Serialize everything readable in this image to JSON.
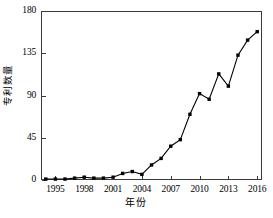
{
  "chart_data": {
    "type": "line",
    "title": "",
    "xlabel": "年份",
    "ylabel": "专利数量",
    "xlim": [
      1993.5,
      2016.5
    ],
    "ylim": [
      0,
      180
    ],
    "grid": false,
    "legend": null,
    "marker": "filled-square",
    "line_color": "#000000",
    "x": [
      1994,
      1995,
      1996,
      1997,
      1998,
      1999,
      2000,
      2001,
      2002,
      2003,
      2004,
      2005,
      2006,
      2007,
      2008,
      2009,
      2010,
      2011,
      2012,
      2013,
      2014,
      2015,
      2016
    ],
    "values": [
      1,
      1,
      1,
      2,
      3,
      2,
      2,
      3,
      7,
      9,
      6,
      16,
      23,
      36,
      43,
      70,
      92,
      86,
      113,
      100,
      133,
      149,
      158
    ],
    "series": [
      {
        "name": "专利数量",
        "values": [
          1,
          1,
          1,
          2,
          3,
          2,
          2,
          3,
          7,
          9,
          6,
          16,
          23,
          36,
          43,
          70,
          92,
          86,
          113,
          100,
          133,
          149,
          158
        ]
      }
    ],
    "xticks": [
      1995,
      1998,
      2001,
      2004,
      2007,
      2010,
      2013,
      2016
    ],
    "xtick_labels": [
      "1995",
      "1998",
      "2001",
      "2004",
      "2007",
      "2010",
      "2013",
      "2016"
    ],
    "yticks": [
      0,
      45,
      90,
      135,
      180
    ],
    "ytick_labels": [
      "0",
      "45",
      "90",
      "135",
      "180"
    ]
  }
}
